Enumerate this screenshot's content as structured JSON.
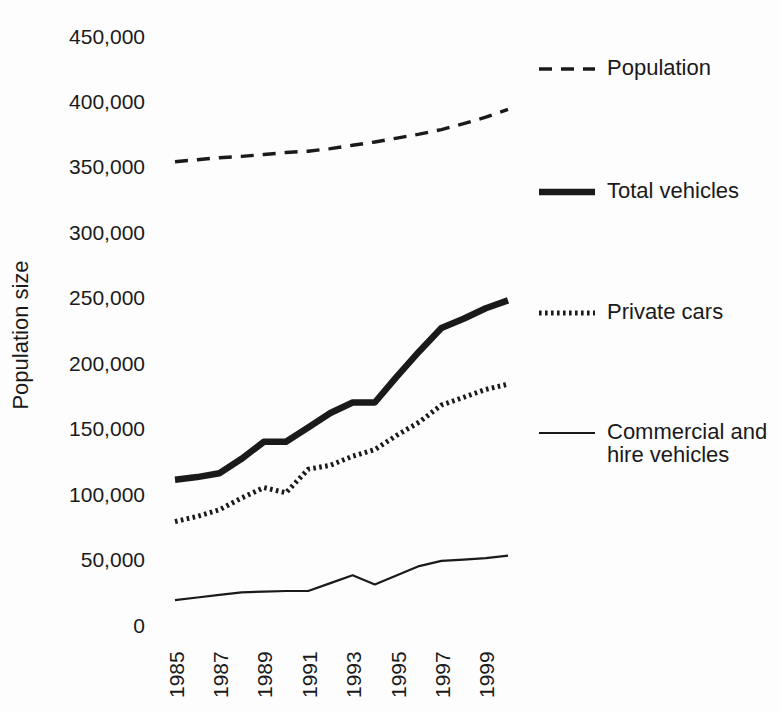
{
  "figure": {
    "background_color": "#fdfdfd",
    "ink_color": "#1a1a1a"
  },
  "chart_data": {
    "type": "line",
    "title": "",
    "xlabel": "",
    "ylabel": "Population size",
    "ylim": [
      0,
      450000
    ],
    "grid": false,
    "legend_position": "right",
    "x": [
      1985,
      1986,
      1987,
      1988,
      1989,
      1990,
      1991,
      1992,
      1993,
      1994,
      1995,
      1996,
      1997,
      1998,
      1999,
      2000
    ],
    "x_tick_labels": [
      "1985",
      "1987",
      "1989",
      "1991",
      "1993",
      "1995",
      "1997",
      "1999"
    ],
    "y_tick_labels": [
      "0",
      "50,000",
      "100,000",
      "150,000",
      "200,000",
      "250,000",
      "300,000",
      "350,000",
      "400,000",
      "450,000"
    ],
    "series": [
      {
        "name": "Population",
        "style": "dashed",
        "values": [
          354000,
          355500,
          357000,
          358000,
          359500,
          361000,
          362000,
          364000,
          366500,
          369000,
          372000,
          375000,
          378500,
          383000,
          388000,
          394000
        ]
      },
      {
        "name": "Total vehicles",
        "style": "thick-solid",
        "values": [
          111000,
          113000,
          116000,
          127000,
          140000,
          140000,
          151000,
          162000,
          170000,
          170000,
          190000,
          209000,
          227000,
          234000,
          242000,
          248000
        ]
      },
      {
        "name": "Private cars",
        "style": "dotted",
        "values": [
          79000,
          83000,
          88000,
          97000,
          105000,
          101000,
          119000,
          122000,
          129000,
          134000,
          145000,
          155000,
          168000,
          174000,
          180000,
          184000
        ]
      },
      {
        "name": "Commercial and hire vehicles",
        "style": "thin-solid",
        "values": [
          19000,
          21000,
          23000,
          25000,
          25500,
          26000,
          26000,
          32000,
          38000,
          31000,
          38000,
          45000,
          49000,
          50000,
          51000,
          53000
        ]
      }
    ]
  }
}
